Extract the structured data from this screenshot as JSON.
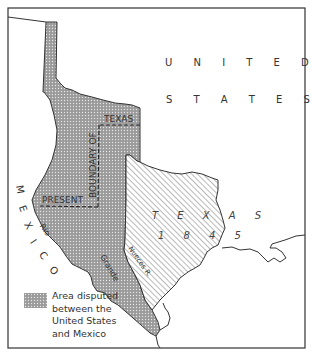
{
  "map": {
    "labels": {
      "united": "U N I T E D",
      "states": "S T A T E S",
      "texas_word": "T E X A S",
      "texas_year": "1 8 4 5",
      "boundary_of": "BOUNDARY OF",
      "texas_boundary": "TEXAS",
      "present": "PRESENT",
      "mexico_letters": [
        "M",
        "E",
        "X",
        "I",
        "C",
        "O"
      ],
      "rio": "Rio",
      "grande": "Grande",
      "nueces": "Nueces R."
    },
    "legend": {
      "item": "Area disputed between the United States and Mexico",
      "lines": [
        "Area disputed",
        "between the",
        "United States",
        "and Mexico"
      ]
    },
    "colors": {
      "frame": "#333333",
      "disputed_fill": "#9a9a9a",
      "texas_hatch": "#888888",
      "background": "#ffffff"
    }
  }
}
